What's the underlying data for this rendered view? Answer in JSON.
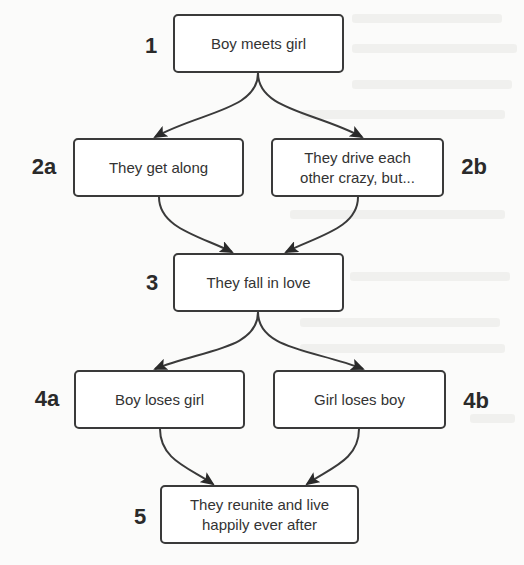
{
  "diagram": {
    "type": "flowchart",
    "colors": {
      "stroke": "#3a3a3a",
      "text": "#333333",
      "label": "#2a2a2a",
      "background": "#fbfbfa"
    },
    "nodes": [
      {
        "id": "1",
        "step": "1",
        "text": "Boy meets girl"
      },
      {
        "id": "2a",
        "step": "2a",
        "text": "They get along"
      },
      {
        "id": "2b",
        "step": "2b",
        "text": "They drive each\nother crazy, but..."
      },
      {
        "id": "3",
        "step": "3",
        "text": "They fall in love"
      },
      {
        "id": "4a",
        "step": "4a",
        "text": "Boy loses girl"
      },
      {
        "id": "4b",
        "step": "4b",
        "text": "Girl loses boy"
      },
      {
        "id": "5",
        "step": "5",
        "text": "They reunite and live\nhappily ever after"
      }
    ],
    "edges": [
      {
        "from": "1",
        "to": "2a"
      },
      {
        "from": "1",
        "to": "2b"
      },
      {
        "from": "2a",
        "to": "3"
      },
      {
        "from": "2b",
        "to": "3"
      },
      {
        "from": "3",
        "to": "4a"
      },
      {
        "from": "3",
        "to": "4b"
      },
      {
        "from": "4a",
        "to": "5"
      },
      {
        "from": "4b",
        "to": "5"
      }
    ]
  }
}
